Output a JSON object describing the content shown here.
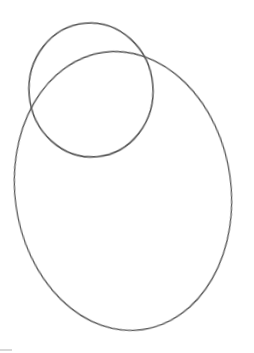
{
  "image": {
    "description": "Pencil sketch of a small circle overlapping the top of a larger oval",
    "background": "#ffffff",
    "stroke_color": "#5a5a5a",
    "shapes": [
      {
        "name": "small-circle",
        "cx": 91,
        "cy": 90,
        "rx": 62,
        "ry": 67,
        "rotate": -5
      },
      {
        "name": "large-oval",
        "cx": 123,
        "cy": 191,
        "rx": 108,
        "ry": 140,
        "rotate": -8
      }
    ]
  }
}
